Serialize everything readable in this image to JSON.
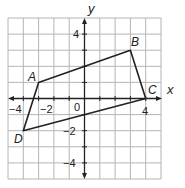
{
  "graph": {
    "axis_labels": {
      "x": "x",
      "y": "y"
    },
    "x_range": [
      -5,
      5
    ],
    "y_range": [
      -5,
      5
    ],
    "grid_step": 1,
    "x_tick_labels": [
      {
        "value": -4,
        "text": "−4"
      },
      {
        "value": -2,
        "text": "−2"
      },
      {
        "value": 0,
        "text": "0"
      },
      {
        "value": 4,
        "text": "4"
      }
    ],
    "y_tick_labels": [
      {
        "value": 4,
        "text": "4"
      },
      {
        "value": -2,
        "text": "−2"
      },
      {
        "value": -4,
        "text": "−4"
      }
    ],
    "polygon": {
      "vertices": [
        {
          "name": "A",
          "x": -3,
          "y": 1
        },
        {
          "name": "B",
          "x": 3,
          "y": 3
        },
        {
          "name": "C",
          "x": 4,
          "y": 0
        },
        {
          "name": "D",
          "x": -4,
          "y": -2
        }
      ]
    },
    "colors": {
      "grid": "#b4b4b4",
      "axis": "#222222",
      "polygon": "#222222",
      "background": "#ffffff"
    }
  }
}
